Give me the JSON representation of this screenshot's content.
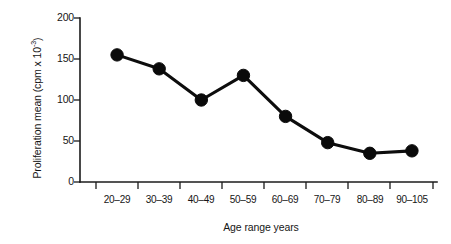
{
  "chart_data": {
    "type": "line",
    "title": "",
    "subtitle": "",
    "xlabel": "Age range years",
    "ylabel": "Proliferation mean (cpm x 10",
    "ylabel_exponent": "-3",
    "ylabel_suffix": ")",
    "categories": [
      "20–29",
      "30–39",
      "40–49",
      "50–59",
      "60–69",
      "70–79",
      "80–89",
      "90–105"
    ],
    "values": [
      155,
      138,
      100,
      130,
      80,
      48,
      35,
      38
    ],
    "series": [
      {
        "name": "Proliferation mean",
        "values": [
          155,
          138,
          100,
          130,
          80,
          48,
          35,
          38
        ],
        "color": "#0a0a0a",
        "marker": "filled-circle"
      }
    ],
    "ylim": [
      0,
      200
    ],
    "yticks": [
      0,
      50,
      100,
      150,
      200
    ],
    "ytick_labels": [
      "0",
      "50",
      "100",
      "150",
      "200"
    ],
    "grid": false,
    "legend": false,
    "legend_position": "none",
    "annotations": [],
    "background_color": "#ffffff",
    "axis_color": "#1b1b1b"
  }
}
